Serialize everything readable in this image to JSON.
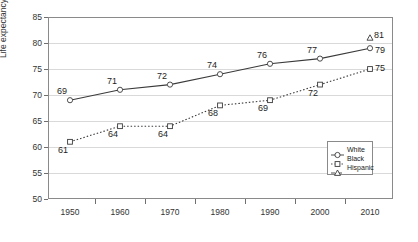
{
  "chart_data": {
    "type": "line",
    "title": "",
    "xlabel": "",
    "ylabel": "Life expectancy in years",
    "categories": [
      "1950",
      "1960",
      "1970",
      "1980",
      "1990",
      "2000",
      "2010"
    ],
    "x": [
      1950,
      1960,
      1970,
      1980,
      1990,
      2000,
      2010
    ],
    "xlim": [
      1945,
      2015
    ],
    "ylim": [
      50,
      85
    ],
    "yticks": [
      50,
      55,
      60,
      65,
      70,
      75,
      80,
      85
    ],
    "grid": true,
    "legend_position": "inside-lower-right",
    "series": [
      {
        "name": "White",
        "marker": "circle",
        "linestyle": "solid",
        "values": [
          69,
          71,
          72,
          74,
          76,
          77,
          79
        ],
        "labels": [
          "69",
          "71",
          "72",
          "74",
          "76",
          "77",
          "79"
        ]
      },
      {
        "name": "Black",
        "marker": "square",
        "linestyle": "dotted",
        "values": [
          61,
          64,
          64,
          68,
          69,
          72,
          75
        ],
        "labels": [
          "61",
          "64",
          "64",
          "68",
          "69",
          "72",
          "75"
        ]
      },
      {
        "name": "Hispanic",
        "marker": "triangle",
        "linestyle": "dashed",
        "values": [
          null,
          null,
          null,
          null,
          null,
          null,
          81
        ],
        "labels": [
          "",
          "",
          "",
          "",
          "",
          "",
          "81"
        ]
      }
    ]
  },
  "legend": {
    "items": [
      {
        "label": "White"
      },
      {
        "label": "Black"
      },
      {
        "label": "Hispanic"
      }
    ]
  }
}
